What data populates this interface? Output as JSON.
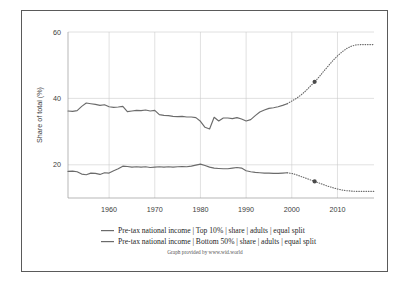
{
  "chart_data": {
    "type": "line",
    "title": "",
    "xlabel": "",
    "ylabel": "Share of total (%)",
    "xlim": [
      1951,
      2018
    ],
    "ylim": [
      10,
      60
    ],
    "yticks": [
      20,
      40,
      60
    ],
    "ytick_labels": [
      "20",
      "40",
      "60"
    ],
    "xticks": [
      1960,
      1970,
      1980,
      1990,
      2000,
      2010
    ],
    "xtick_labels": [
      "1960",
      "1970",
      "1980",
      "1990",
      "2000",
      "2010"
    ],
    "grid": true,
    "legend_position": "bottom",
    "attribution": "Graph provided by www.wid.world",
    "series": [
      {
        "name": "Pre-tax national income | Top 10% | share | adults | equal split",
        "color": "#6b6b6b",
        "solid_x": [
          1951,
          1952,
          1953,
          1954,
          1955,
          1956,
          1957,
          1958,
          1959,
          1960,
          1961,
          1962,
          1963,
          1964,
          1965,
          1966,
          1967,
          1968,
          1969,
          1970,
          1971,
          1972,
          1973,
          1974,
          1975,
          1976,
          1977,
          1978,
          1979,
          1980,
          1981,
          1982,
          1983,
          1984,
          1985,
          1986,
          1987,
          1988,
          1989,
          1990,
          1991,
          1992,
          1993,
          1994,
          1995,
          1996,
          1997,
          1998,
          1999
        ],
        "solid_y": [
          36.2,
          36.1,
          36.3,
          37.6,
          38.6,
          38.4,
          38.2,
          37.9,
          38.1,
          37.5,
          37.3,
          37.4,
          37.6,
          36.0,
          36.2,
          36.4,
          36.3,
          36.5,
          36.2,
          36.4,
          35.1,
          34.9,
          34.8,
          34.6,
          34.5,
          34.6,
          34.4,
          34.4,
          34.2,
          33.1,
          31.3,
          30.8,
          34.3,
          33.2,
          34.1,
          34.1,
          33.9,
          34.2,
          33.8,
          33.2,
          33.6,
          34.8,
          35.9,
          36.5,
          37.0,
          37.2,
          37.5,
          37.9,
          38.4
        ],
        "dotted_x": [
          1999,
          2000,
          2001,
          2002,
          2003,
          2004,
          2005,
          2006,
          2007,
          2008,
          2009,
          2010,
          2011,
          2012,
          2013,
          2014,
          2015,
          2016,
          2017,
          2018
        ],
        "dotted_y": [
          38.4,
          39.2,
          40.0,
          41.0,
          42.2,
          43.6,
          45.0,
          46.5,
          48.2,
          49.8,
          51.4,
          52.8,
          54.0,
          55.0,
          55.7,
          56.1,
          56.2,
          56.2,
          56.2,
          56.2
        ],
        "markers": [
          {
            "x": 2005,
            "y": 45.0
          }
        ]
      },
      {
        "name": "Pre-tax national income | Bottom 50% | share | adults | equal split",
        "color": "#6b6b6b",
        "solid_x": [
          1951,
          1952,
          1953,
          1954,
          1955,
          1956,
          1957,
          1958,
          1959,
          1960,
          1961,
          1962,
          1963,
          1964,
          1965,
          1966,
          1967,
          1968,
          1969,
          1970,
          1971,
          1972,
          1973,
          1974,
          1975,
          1976,
          1977,
          1978,
          1979,
          1980,
          1981,
          1982,
          1983,
          1984,
          1985,
          1986,
          1987,
          1988,
          1989,
          1990,
          1991,
          1992,
          1993,
          1994,
          1995,
          1996,
          1997,
          1998,
          1999
        ],
        "solid_y": [
          18.0,
          18.1,
          17.9,
          17.2,
          17.0,
          17.5,
          17.4,
          17.1,
          17.6,
          17.5,
          18.2,
          18.8,
          19.6,
          19.5,
          19.3,
          19.4,
          19.3,
          19.4,
          19.2,
          19.3,
          19.4,
          19.3,
          19.4,
          19.3,
          19.4,
          19.5,
          19.4,
          19.6,
          19.9,
          20.2,
          19.8,
          19.3,
          19.0,
          18.9,
          18.8,
          18.8,
          19.0,
          19.2,
          19.0,
          18.2,
          17.9,
          17.7,
          17.6,
          17.5,
          17.5,
          17.4,
          17.4,
          17.5,
          17.6
        ],
        "dotted_x": [
          1999,
          2000,
          2001,
          2002,
          2003,
          2004,
          2005,
          2006,
          2007,
          2008,
          2009,
          2010,
          2011,
          2012,
          2013,
          2014,
          2015,
          2016,
          2017,
          2018
        ],
        "dotted_y": [
          17.6,
          17.4,
          17.0,
          16.5,
          16.0,
          15.5,
          15.0,
          14.5,
          14.0,
          13.5,
          13.1,
          12.7,
          12.4,
          12.2,
          12.1,
          12.0,
          12.0,
          12.0,
          12.0,
          12.0
        ],
        "markers": [
          {
            "x": 2005,
            "y": 15.0
          }
        ]
      }
    ]
  },
  "legend": {
    "items": [
      {
        "label": "Pre-tax national income | Top 10% | share | adults | equal split"
      },
      {
        "label": "Pre-tax national income | Bottom 50% | share | adults | equal split"
      }
    ]
  },
  "footer": {
    "attribution": "Graph provided by www.wid.world"
  },
  "axes": {
    "y_title": "Share of total (%)",
    "y_labels": [
      "60",
      "40",
      "20"
    ],
    "x_labels": [
      "1960",
      "1970",
      "1980",
      "1990",
      "2000",
      "2010"
    ]
  }
}
